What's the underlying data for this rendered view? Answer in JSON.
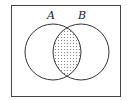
{
  "diagram": {
    "type": "venn",
    "sets": [
      {
        "label": "A",
        "cx": 53,
        "cy": 52,
        "r": 28
      },
      {
        "label": "B",
        "cx": 81,
        "cy": 52,
        "r": 28
      }
    ],
    "shaded_region": "A ∩ B",
    "colors": {
      "stroke": "#333333",
      "shade": "#888888",
      "background": "#ffffff"
    }
  }
}
